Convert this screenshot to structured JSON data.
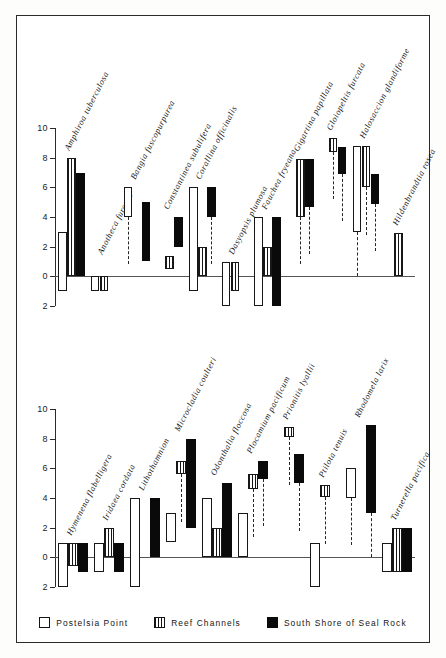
{
  "figure": {
    "panels": [
      "top",
      "bottom"
    ],
    "y_ticks": [
      10,
      8,
      6,
      4,
      2,
      0,
      2
    ],
    "colors": {
      "postelsia_point": "#ffffff",
      "reef_channels": "#ffffff",
      "seal_rock": "#0a0a0a",
      "ink": "#171717",
      "axis": "#2b2b2b"
    }
  },
  "legend": {
    "items": [
      {
        "label": "Postelsia Point",
        "style": "open",
        "icon": "open-square-icon"
      },
      {
        "label": "Reef Channels",
        "style": "hatch",
        "icon": "hatched-square-icon"
      },
      {
        "label": "South Shore of Seal Rock",
        "style": "solid",
        "icon": "filled-square-icon"
      }
    ]
  },
  "chart_data": {
    "type": "bar",
    "title": "",
    "xlabel": "",
    "ylabel": "",
    "ylim": [
      -2,
      10
    ],
    "grid": false,
    "legend_position": "bottom",
    "axis_tick_labels": [
      "10",
      "8",
      "6",
      "4",
      "2",
      "0",
      "2"
    ],
    "axis_tick_values": [
      10,
      8,
      6,
      4,
      2,
      0,
      -2
    ],
    "note": "Floating range bars: each bar spans from low to high on the vertical scale. Series: Postelsia Point (open), Reef Channels (hatched), South Shore of Seal Rock (solid).",
    "series_names": [
      "Postelsia Point",
      "Reef Channels",
      "South Shore of Seal Rock"
    ],
    "panels": [
      {
        "name": "top",
        "categories": [
          "Amphiroa tuberculosa",
          "Anotheca furcata",
          "Bangia fuscopurpurea",
          "Constantinea subulifera",
          "Corallina officinalis",
          "Dasyopsis plumosa",
          "Fauchea fryeana",
          "Gigartina papillata",
          "Gloiopeltis furcata",
          "Halosaccion glandiforme",
          "Hildenbrandtia rosea"
        ],
        "bars": [
          {
            "category": "Amphiroa tuberculosa",
            "postelsia_point": [
              -1,
              3
            ],
            "reef_channels": [
              0,
              8
            ],
            "seal_rock": [
              0,
              7
            ]
          },
          {
            "category": "Anotheca furcata",
            "postelsia_point": [
              -1,
              0
            ],
            "reef_channels": [
              -1,
              0
            ],
            "seal_rock": null
          },
          {
            "category": "Bangia fuscopurpurea",
            "postelsia_point": [
              4,
              6
            ],
            "reef_channels": null,
            "seal_rock": [
              1,
              5
            ]
          },
          {
            "category": "Constantinea subulifera",
            "postelsia_point": null,
            "reef_channels": [
              0.5,
              1.4
            ],
            "seal_rock": [
              2,
              4
            ]
          },
          {
            "category": "Corallina officinalis",
            "postelsia_point": [
              -1,
              6
            ],
            "reef_channels": [
              0,
              2
            ],
            "seal_rock": [
              4,
              6
            ]
          },
          {
            "category": "Dasyopsis plumosa",
            "postelsia_point": [
              -2,
              1
            ],
            "reef_channels": [
              -1,
              1
            ],
            "seal_rock": null
          },
          {
            "category": "Fauchea fryeana",
            "postelsia_point": [
              -2,
              4
            ],
            "reef_channels": [
              0,
              2
            ],
            "seal_rock": [
              -2,
              4
            ]
          },
          {
            "category": "Gigartina papillata",
            "postelsia_point": null,
            "reef_channels": [
              4,
              7.9
            ],
            "seal_rock": [
              4.7,
              7.9
            ]
          },
          {
            "category": "Gloiopeltis furcata",
            "postelsia_point": null,
            "reef_channels": [
              8.4,
              9.3
            ],
            "seal_rock": [
              6.9,
              8.7
            ]
          },
          {
            "category": "Halosaccion glandiforme",
            "postelsia_point": [
              3,
              8.8
            ],
            "reef_channels": [
              6,
              8.8
            ],
            "seal_rock": [
              4.9,
              6.9
            ]
          },
          {
            "category": "Hildenbrandtia rosea",
            "postelsia_point": null,
            "reef_channels": [
              0,
              2.9
            ],
            "seal_rock": null
          }
        ]
      },
      {
        "name": "bottom",
        "categories": [
          "Hymenena flabelligera",
          "Iridaea cordata",
          "Lithothamnion",
          "Microcladia coulteri",
          "Odonthalia floccosa",
          "Plocamium pacificum",
          "Prionitis lyallii",
          "Ptilota tenuis",
          "Rhodomela larix",
          "Turnerella pacifica"
        ],
        "bars": [
          {
            "category": "Hymenena flabelligera",
            "postelsia_point": [
              -2,
              1
            ],
            "reef_channels": [
              -0.6,
              1
            ],
            "seal_rock": [
              -1,
              1
            ]
          },
          {
            "category": "Iridaea cordata",
            "postelsia_point": [
              -1,
              1
            ],
            "reef_channels": [
              0,
              2
            ],
            "seal_rock": [
              -1,
              1
            ]
          },
          {
            "category": "Lithothamnion",
            "postelsia_point": [
              -2,
              4
            ],
            "reef_channels": null,
            "seal_rock": [
              0,
              4
            ]
          },
          {
            "category": "Microcladia coulteri",
            "postelsia_point": [
              1,
              3
            ],
            "reef_channels": [
              5.6,
              6.5
            ],
            "seal_rock": [
              2,
              8
            ]
          },
          {
            "category": "Odonthalia floccosa",
            "postelsia_point": [
              0,
              4
            ],
            "reef_channels": [
              0,
              2
            ],
            "seal_rock": [
              0,
              5
            ]
          },
          {
            "category": "Plocamium pacificum",
            "postelsia_point": [
              0,
              3
            ],
            "reef_channels": [
              4.6,
              5.6
            ],
            "seal_rock": [
              5.3,
              6.5
            ]
          },
          {
            "category": "Prionitis lyallii",
            "postelsia_point": null,
            "reef_channels": [
              8.1,
              8.8
            ],
            "seal_rock": [
              5,
              7
            ]
          },
          {
            "category": "Ptilota tenuis",
            "postelsia_point": [
              -2,
              1
            ],
            "reef_channels": [
              4.1,
              4.9
            ],
            "seal_rock": null
          },
          {
            "category": "Rhodomela larix",
            "postelsia_point": [
              4,
              6
            ],
            "reef_channels": null,
            "seal_rock": [
              3,
              8.9
            ]
          },
          {
            "category": "Turnerella pacifica",
            "postelsia_point": [
              -1,
              1
            ],
            "reef_channels": [
              -1,
              2
            ],
            "seal_rock": [
              -1,
              2
            ]
          }
        ]
      }
    ]
  }
}
